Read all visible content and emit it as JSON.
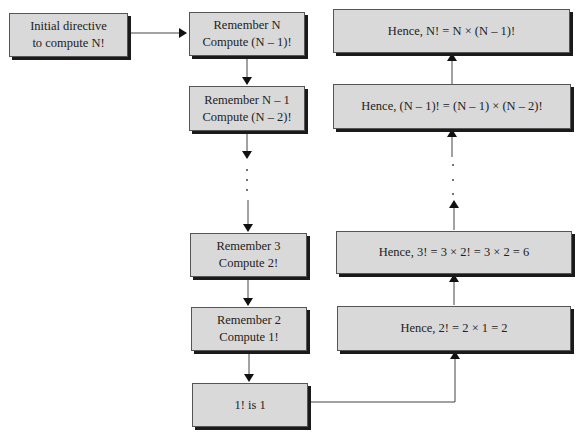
{
  "diagram": {
    "left": {
      "start": {
        "line1": "Initial directive",
        "line2": "to compute N!"
      }
    },
    "middle": [
      {
        "line1": "Remember N",
        "line2": "Compute (N – 1)!"
      },
      {
        "line1": "Remember N – 1",
        "line2": "Compute (N – 2)!"
      },
      {
        "line1": "Remember 3",
        "line2": "Compute 2!"
      },
      {
        "line1": "Remember 2",
        "line2": "Compute 1!"
      },
      {
        "line1": "1! is 1"
      }
    ],
    "right": [
      {
        "text": "Hence, N! = N × (N – 1)!"
      },
      {
        "text": "Hence, (N – 1)! = (N – 1) × (N – 2)!"
      },
      {
        "text": "Hence, 3! = 3 × 2! = 3 × 2 = 6"
      },
      {
        "text": "Hence, 2! = 2 × 1 = 2"
      }
    ],
    "ellipsis": "·",
    "colors": {
      "box_fill": "#d9d9d9",
      "shadow": "#1a1a1a",
      "line": "#444444"
    }
  }
}
